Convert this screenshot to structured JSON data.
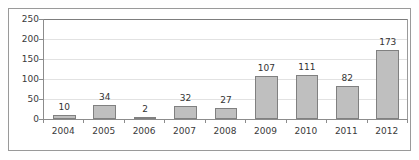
{
  "chart_data": {
    "type": "bar",
    "title": "",
    "subtitle": "",
    "xlabel": "",
    "ylabel": "",
    "categories": [
      "2004",
      "2005",
      "2006",
      "2007",
      "2008",
      "2009",
      "2010",
      "2011",
      "2012"
    ],
    "values": [
      10,
      34,
      2,
      32,
      27,
      107,
      111,
      82,
      173
    ],
    "data_labels": [
      "10",
      "34",
      "2",
      "32",
      "27",
      "107",
      "111",
      "82",
      "173"
    ],
    "ylim": [
      0,
      250
    ],
    "yticks": [
      0,
      50,
      100,
      150,
      200,
      250
    ],
    "ytick_labels": [
      "0",
      "50",
      "100",
      "150",
      "200",
      "250"
    ],
    "grid": true,
    "grid_axis": "y",
    "legend": false,
    "legend_position": "none",
    "series": [
      {
        "name": "",
        "values": [
          10,
          34,
          2,
          32,
          27,
          107,
          111,
          82,
          173
        ]
      }
    ],
    "colors": {
      "bar_fill": "#bfbfbf",
      "bar_border": "#808080",
      "gridline": "#e2e2e2",
      "axis": "#8c8c8c",
      "frame": "#9a9a9a",
      "label_text": "#333333",
      "tick_text": "#3a3a3a",
      "background": "#ffffff"
    }
  }
}
